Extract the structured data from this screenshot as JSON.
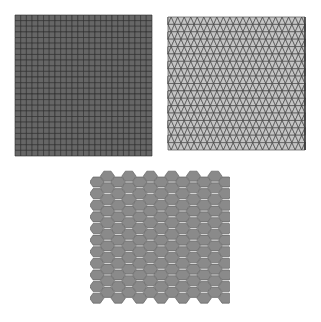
{
  "figure": {
    "background": "#ffffff",
    "panels": [
      {
        "id": "square-grid",
        "shape": "square",
        "x": 15,
        "y": 15,
        "width": 137,
        "height": 141,
        "cols": 24,
        "rows": 25,
        "fill": "#666666",
        "stroke": "#2a2a2a"
      },
      {
        "id": "triangle-grid",
        "shape": "triangle",
        "x": 168,
        "y": 17,
        "width": 137,
        "height": 133,
        "cols": 21,
        "rows": 18,
        "fill": "#c4c4c4",
        "stroke": "#3a3a3a"
      },
      {
        "id": "hexagon-grid",
        "shape": "hexagon",
        "x": 92,
        "y": 170,
        "width": 136,
        "height": 134,
        "cols": 13,
        "rows": 11,
        "fill": "#8a8a8a",
        "stroke": "#555555"
      }
    ]
  }
}
